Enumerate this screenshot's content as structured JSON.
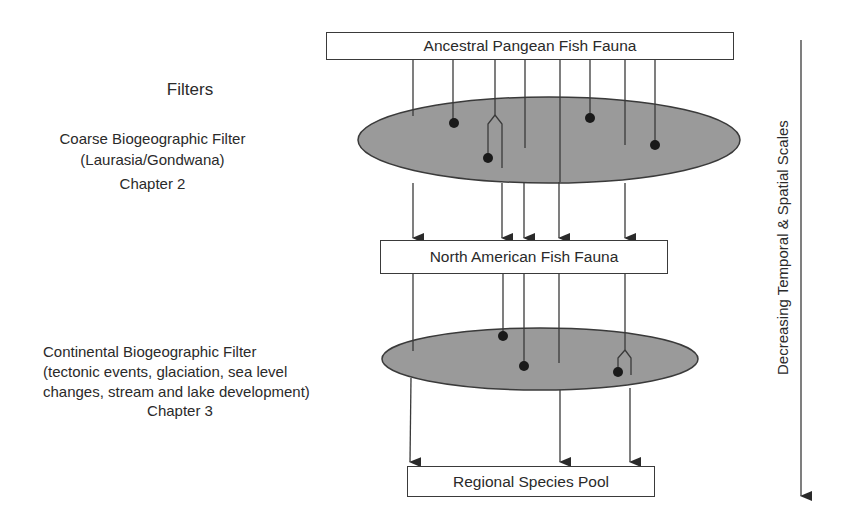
{
  "diagram": {
    "boxes": {
      "ancestral": "Ancestral Pangean Fish Fauna",
      "north_american": "North American Fish Fauna",
      "regional": "Regional Species Pool"
    },
    "filters_heading": "Filters",
    "coarse_filter": {
      "title": "Coarse Biogeographic Filter",
      "subtitle": "(Laurasia/Gondwana)",
      "chapter": "Chapter 2"
    },
    "continental_filter": {
      "title": "Continental Biogeographic Filter",
      "line2": "(tectonic events, glaciation, sea level",
      "line3": "changes, stream and lake development)",
      "chapter": "Chapter 3"
    },
    "scale_axis_label": "Decreasing Temporal & Spatial Scales",
    "colors": {
      "filter_fill": "#9a9a9a",
      "line": "#3a3a3a",
      "dot": "#1a1a1a"
    },
    "lineages_level1": {
      "origins_x": [
        413,
        453,
        496,
        523,
        559,
        590,
        625,
        655
      ],
      "passing_x": [
        413,
        502,
        524,
        559,
        625
      ]
    },
    "lineages_level2": {
      "origins_x": [
        413,
        502,
        524,
        559,
        625
      ],
      "passing_x": [
        410,
        560,
        630
      ]
    }
  }
}
